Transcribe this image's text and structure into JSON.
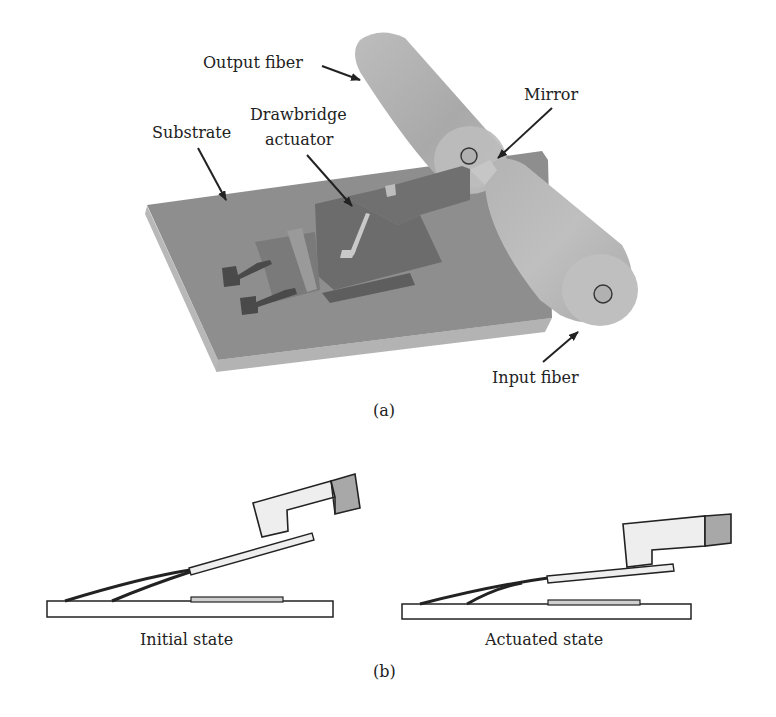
{
  "figure": {
    "panel_a": {
      "caption": "(a)",
      "labels": {
        "output_fiber": "Output fiber",
        "substrate": "Substrate",
        "drawbridge_line1": "Drawbridge",
        "drawbridge_line2": "actuator",
        "mirror": "Mirror",
        "input_fiber": "Input fiber"
      }
    },
    "panel_b": {
      "caption": "(b)",
      "states": [
        {
          "label": "Initial state"
        },
        {
          "label": "Actuated state"
        }
      ]
    },
    "colors": {
      "substrate_top": "#8f8f8f",
      "substrate_side": "#b5b5b5",
      "fiber": "#b9b9b9",
      "actuator": "#6f6f6f",
      "electrode": "#4a4a4a",
      "mirror_fill": "#eeeeee",
      "mirror_tip": "#a8a8a8",
      "outline": "#222222"
    }
  }
}
